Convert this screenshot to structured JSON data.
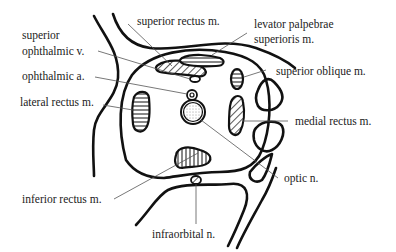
{
  "diagram": {
    "type": "anatomical cross-section of the orbit",
    "labels": {
      "superior_rectus": "superior rectus m.",
      "levator_line1": "levator palpebrae",
      "levator_line2": "superioris m.",
      "sup_ophth_v_line1": "superior",
      "sup_ophth_v_line2": "ophthalmic v.",
      "ophthalmic_a": "ophthalmic a.",
      "lateral_rectus": "lateral rectus m.",
      "superior_oblique": "superior oblique m.",
      "medial_rectus": "medial rectus m.",
      "optic_n": "optic n.",
      "inferior_rectus": "inferior rectus m.",
      "infraorbital_n": "infraorbital n."
    },
    "colors": {
      "stroke": "#111111",
      "leader": "#555555",
      "text": "#222222",
      "background": "#ffffff"
    }
  }
}
